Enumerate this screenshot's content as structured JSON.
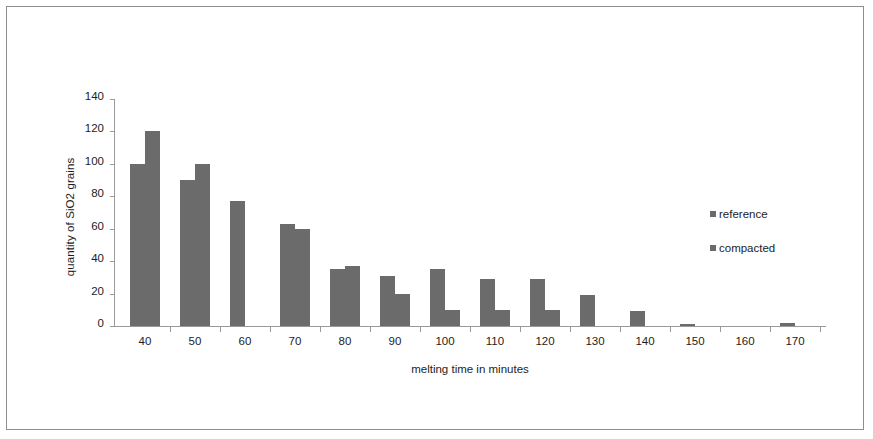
{
  "chart_data": {
    "type": "bar",
    "title": "",
    "xlabel": "melting time in minutes",
    "ylabel": "quantity of SiO2 grains",
    "categories": [
      "40",
      "50",
      "60",
      "70",
      "80",
      "90",
      "100",
      "110",
      "120",
      "130",
      "140",
      "150",
      "160",
      "170"
    ],
    "series": [
      {
        "name": "reference",
        "values": [
          100,
          90,
          77,
          63,
          35,
          31,
          35,
          29,
          29,
          19,
          9,
          1,
          0,
          2
        ]
      },
      {
        "name": "compacted",
        "values": [
          120,
          100,
          0,
          60,
          37,
          20,
          10,
          10,
          10,
          0,
          0,
          0,
          0,
          0
        ]
      }
    ],
    "ylim": [
      0,
      140
    ],
    "ytick_labels": [
      "140",
      "120",
      "100",
      "80",
      "60",
      "40",
      "20",
      "0"
    ],
    "ytick_values": [
      140,
      120,
      100,
      80,
      60,
      40,
      20,
      0
    ],
    "grid": false,
    "legend_position": "right",
    "bar_color": "#6b6b6b",
    "axis_color": "#9a9a9a",
    "text_color": "#1d1d1d",
    "border_color": "#8d8d8d"
  },
  "legend": {
    "entries": [
      {
        "label": "reference"
      },
      {
        "label": "compacted"
      }
    ]
  }
}
